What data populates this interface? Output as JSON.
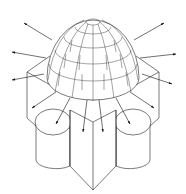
{
  "figure": {
    "title": "",
    "colors": {
      "line": "#222222",
      "background": "#ffffff"
    },
    "components": [
      {
        "name": "dome",
        "type": "segmented-hemisphere"
      },
      {
        "name": "square-base",
        "type": "isometric-block"
      },
      {
        "name": "cylinder-lobes",
        "count": 4
      },
      {
        "name": "radiating-arrows",
        "count": 12
      }
    ]
  }
}
